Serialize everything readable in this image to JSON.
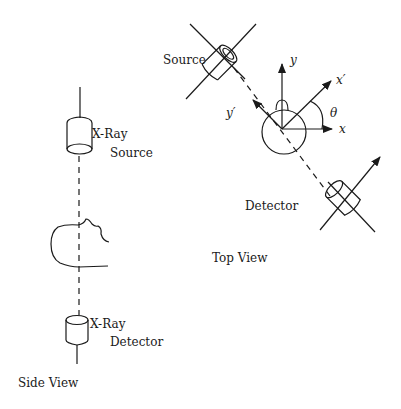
{
  "side_view": {
    "title": "Side View",
    "source_label_line1": "X-Ray",
    "source_label_line2": "Source",
    "detector_label_line1": "X-Ray",
    "detector_label_line2": "Detector"
  },
  "top_view": {
    "title": "Top View",
    "source_label": "Source",
    "detector_label": "Detector",
    "axes": {
      "x": "x",
      "y": "y",
      "x_prime": "x′",
      "y_prime": "y′",
      "angle": "θ"
    }
  }
}
